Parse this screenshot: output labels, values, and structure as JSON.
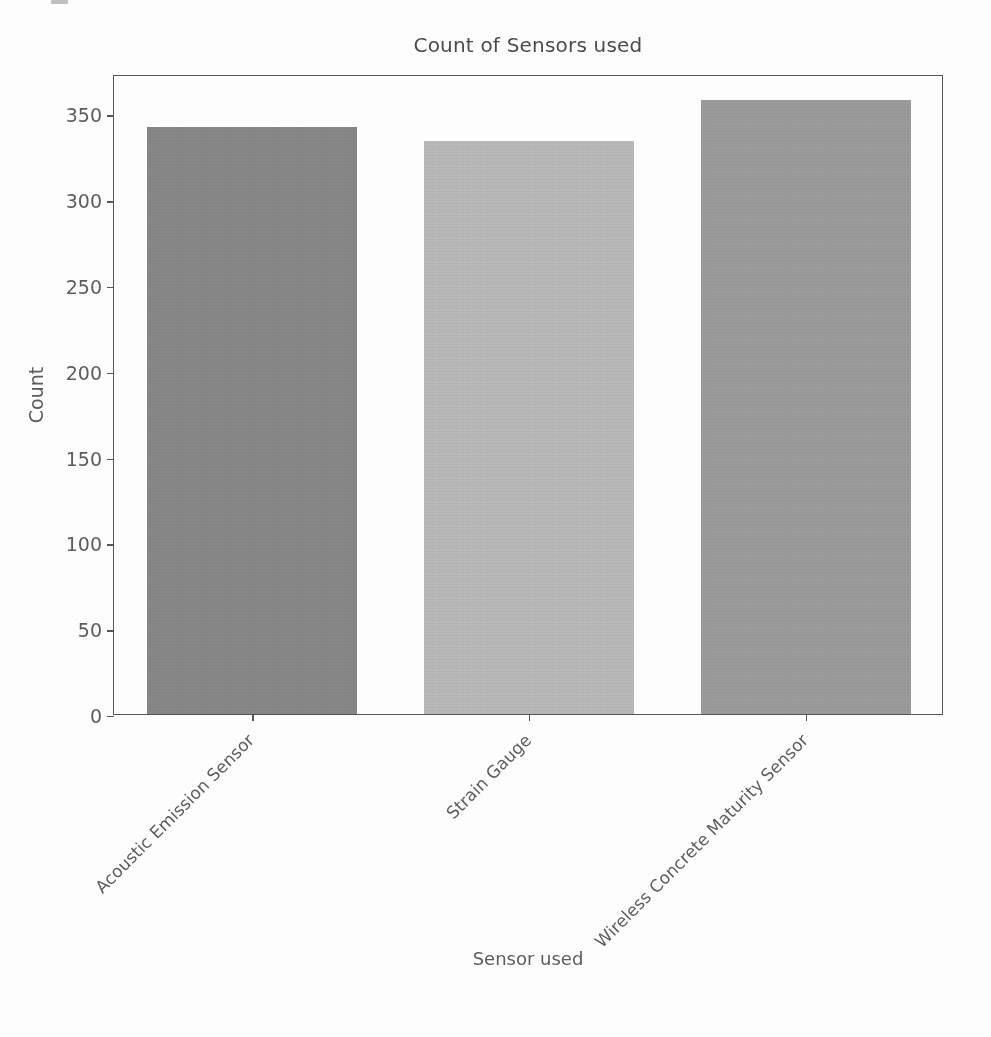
{
  "chart_data": {
    "type": "bar",
    "title": "Count of Sensors used",
    "xlabel": "Sensor used",
    "ylabel": "Count",
    "categories": [
      "Acoustic Emission Sensor",
      "Strain Gauge",
      "Wireless Concrete Maturity Sensor"
    ],
    "values": [
      342,
      334,
      358
    ],
    "series": [
      {
        "name": "Count",
        "values": [
          342,
          334,
          358
        ]
      }
    ],
    "bar_colors": [
      "#8a8a8a",
      "#bcbcbc",
      "#9e9e9e"
    ],
    "ylim": [
      0,
      373
    ],
    "yticks": [
      0,
      50,
      100,
      150,
      200,
      250,
      300,
      350
    ],
    "ytick_labels": [
      "0",
      "50",
      "100",
      "150",
      "200",
      "250",
      "300",
      "350"
    ],
    "grid": false,
    "legend": false,
    "xtick_label_rotation": -45,
    "axes_edge_color": "#575757",
    "background_color": "#ffffff",
    "text_color": "#5e5e5e"
  },
  "figure": {
    "title": "Count of Sensors used",
    "axis": {
      "y_label": "Count",
      "x_label": "Sensor used"
    }
  }
}
